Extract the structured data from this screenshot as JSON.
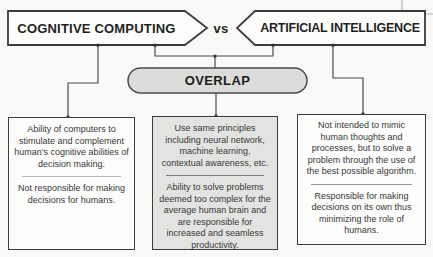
{
  "banners": {
    "left_label": "COGNITIVE COMPUTING",
    "vs_label": "vs",
    "right_label": "ARTIFICIAL INTELLIGENCE"
  },
  "overlap": {
    "label": "OVERLAP"
  },
  "columns": [
    {
      "name": "cognitive-computing-description",
      "top": "Ability of computers to stimulate and complement human's cognitive abilities of decision making.",
      "bottom": "Not responsible for making decisions for humans."
    },
    {
      "name": "overlap-description",
      "top": "Use same principles including neural network, machine learning, contextual awareness, etc.",
      "bottom": "Ability to solve problems deemed too complex for the average human brain and are responsible for increased and seamless productivity."
    },
    {
      "name": "artificial-intelligence-description",
      "top": "Not intended to mimic human thoughts and processes, but to solve a problem through the use of the best possible algorithm.",
      "bottom": "Responsible for making decisions on its own thus minimizing the role of humans."
    }
  ],
  "colors": {
    "background": "#f9f9f7",
    "shape_border": "#3c3c3c",
    "connector": "#4a4a4a",
    "overlap_fill": "#dcdcda",
    "middle_box_fill": "#e3e3e1",
    "text": "#383838"
  }
}
